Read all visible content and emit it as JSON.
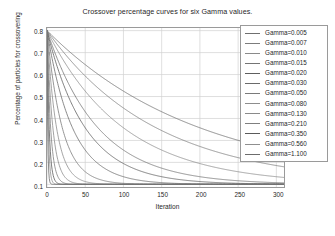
{
  "chart_data": {
    "type": "line",
    "title": "Crossover percentage curves for six Gamma values.",
    "xlabel": "Iteration",
    "ylabel": "Percentage of particles for crossovering",
    "xlim": [
      0,
      310
    ],
    "ylim": [
      0.088,
      0.812
    ],
    "xticks": [
      0,
      50,
      100,
      150,
      200,
      250,
      300
    ],
    "xtick_labels": [
      "0",
      "50",
      "100",
      "150",
      "200",
      "250",
      "300"
    ],
    "yticks": [
      0.1,
      0.2,
      0.3,
      0.4,
      0.5,
      0.6,
      0.7,
      0.8
    ],
    "ytick_labels": [
      "0.1",
      "0.2",
      "0.3",
      "0.4",
      "0.5",
      "0.6",
      "0.7",
      "0.8"
    ],
    "grid": true,
    "legend_position": "upper-right",
    "start_value": 0.8,
    "floor_value": 0.1,
    "formula": "y = 0.1 + 0.7 * exp(-gamma * x)",
    "series": [
      {
        "name": "Gamma=0.005",
        "gamma": 0.005,
        "color": "#6f6f6f"
      },
      {
        "name": "Gamma=0.007",
        "gamma": 0.007,
        "color": "#7c7c7c"
      },
      {
        "name": "Gamma=0.010",
        "gamma": 0.01,
        "color": "#8a8a8a"
      },
      {
        "name": "Gamma=0.015",
        "gamma": 0.015,
        "color": "#747474"
      },
      {
        "name": "Gamma=0.020",
        "gamma": 0.02,
        "color": "#5e5e5e"
      },
      {
        "name": "Gamma=0.030",
        "gamma": 0.03,
        "color": "#6a6a6a"
      },
      {
        "name": "Gamma=0.050",
        "gamma": 0.05,
        "color": "#7a7a7a"
      },
      {
        "name": "Gamma=0.080",
        "gamma": 0.08,
        "color": "#8d8d8d"
      },
      {
        "name": "Gamma=0.130",
        "gamma": 0.13,
        "color": "#8a8a8a"
      },
      {
        "name": "Gamma=0.210",
        "gamma": 0.21,
        "color": "#7f7f7f"
      },
      {
        "name": "Gamma=0.350",
        "gamma": 0.35,
        "color": "#5a5a5a"
      },
      {
        "name": "Gamma=0.560",
        "gamma": 0.56,
        "color": "#8f8f8f"
      },
      {
        "name": "Gamma=1.100",
        "gamma": 1.1,
        "color": "#6c6c6c"
      }
    ]
  },
  "style": {
    "grid_color": "#d0d0d0",
    "frame_color": "#9a9a9a",
    "text_color": "#1f1f1f",
    "background": "#ffffff"
  }
}
